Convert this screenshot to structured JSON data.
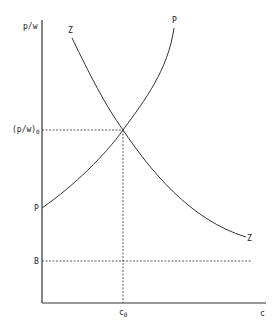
{
  "diagram": {
    "axes": {
      "y_label": "p/w",
      "x_label": "c"
    },
    "curves": [
      {
        "name": "P",
        "label_start": "P",
        "label_end": "P",
        "description": "upward sloping convex curve"
      },
      {
        "name": "Z",
        "label_start": "Z",
        "label_end": "Z",
        "description": "downward sloping convex curve"
      }
    ],
    "equilibrium": {
      "y_label_main": "(p/w)",
      "y_label_sub": "0",
      "x_label_main": "c",
      "x_label_sub": "0"
    },
    "horizontal_line": {
      "label": "B"
    },
    "colors": {
      "stroke": "#333333",
      "background": "#ffffff"
    }
  }
}
